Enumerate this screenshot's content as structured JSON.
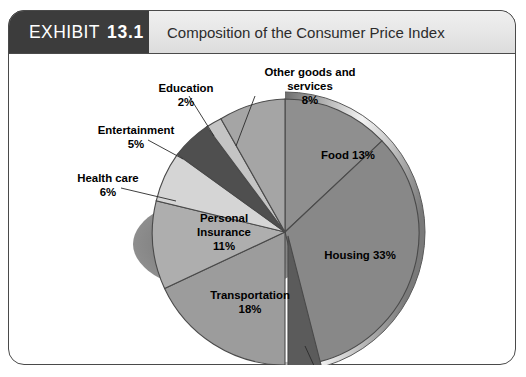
{
  "exhibit": {
    "badge_keyword": "EXHIBIT",
    "badge_number": "13.1",
    "title": "Composition of the Consumer Price Index"
  },
  "colors": {
    "badge_bg": "#3c3c3c",
    "badge_text": "#ffffff",
    "title_bar_bg": "#e6e6e6",
    "frame_border": "#4a4a4a",
    "page_bg": "#ffffff",
    "shadow": "#8a8a8a"
  },
  "chart_data": {
    "type": "pie",
    "title": "Composition of the Consumer Price Index",
    "xlabel": "",
    "ylabel": "",
    "grid": false,
    "legend_position": "none",
    "label_style": "category name + percent, placed inside slice or with leader line",
    "start_angle_deg": 0,
    "direction": "clockwise",
    "units": "percent",
    "total": 100,
    "categories": [
      "Food",
      "Housing",
      "Apparel",
      "Transportation",
      "Personal Insurance",
      "Health care",
      "Entertainment",
      "Education",
      "Other goods and services"
    ],
    "values": [
      13,
      33,
      4,
      18,
      11,
      6,
      5,
      2,
      8
    ],
    "slices": [
      {
        "name": "Food",
        "value": 13,
        "label": "Food 13%",
        "percent_text": "13%",
        "color": "#8f8f8f",
        "label_placement": "inside"
      },
      {
        "name": "Housing",
        "value": 33,
        "label": "Housing  33%",
        "percent_text": "33%",
        "color": "#888888",
        "label_placement": "inside"
      },
      {
        "name": "Apparel",
        "value": 4,
        "label": "Apparel  4%",
        "percent_text": "4%",
        "color": "#5b5b5b",
        "label_placement": "callout-bottom"
      },
      {
        "name": "Transportation",
        "value": 18,
        "label": "Transportation",
        "percent_text": "18%",
        "color": "#9c9c9c",
        "label_placement": "inside"
      },
      {
        "name": "Personal Insurance",
        "value": 11,
        "label": "Personal Insurance",
        "percent_text": "11%",
        "color": "#aeaeae",
        "label_placement": "inside"
      },
      {
        "name": "Health care",
        "value": 6,
        "label": "Health care",
        "percent_text": "6%",
        "color": "#d5d5d5",
        "label_placement": "callout-left"
      },
      {
        "name": "Entertainment",
        "value": 5,
        "label": "Entertainment",
        "percent_text": "5%",
        "color": "#4f4f4f",
        "label_placement": "callout-left"
      },
      {
        "name": "Education",
        "value": 2,
        "label": "Education",
        "percent_text": "2%",
        "color": "#c4c4c4",
        "label_placement": "callout-top"
      },
      {
        "name": "Other goods and services",
        "value": 8,
        "label_line1": "Other goods and",
        "label_line2": "services",
        "percent_text": "8%",
        "color": "#a5a5a5",
        "label_placement": "callout-top"
      }
    ]
  }
}
